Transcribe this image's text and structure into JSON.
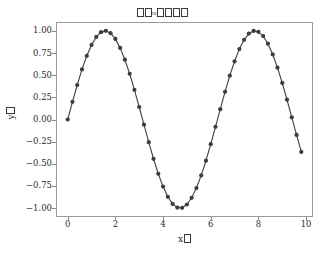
{
  "figure": {
    "width": 325,
    "height": 260,
    "background": "#ffffff"
  },
  "title": {
    "text": "□□nc□□□□",
    "note": "CJK glyphs rendered as missing-glyph boxes",
    "box_count_left": 2,
    "inner_text": "nc",
    "box_count_right": 4
  },
  "axis_labels": {
    "x": {
      "prefix": "x",
      "box_count": 1
    },
    "y": {
      "prefix": "y",
      "box_count": 1
    }
  },
  "style": {
    "line_color": "#404040",
    "marker_color": "#3d3d3d",
    "frame_color": "#9a9a9a",
    "text_color": "#2b2b2b",
    "tick_color": "#8a8a8a"
  },
  "chart_data": {
    "type": "line",
    "xlabel": "x□",
    "ylabel": "y□",
    "xlim": [
      -0.49,
      10.29
    ],
    "ylim": [
      -1.1,
      1.1
    ],
    "xticks": [
      0,
      2,
      4,
      6,
      8,
      10
    ],
    "xtick_labels": [
      "0",
      "2",
      "4",
      "6",
      "8",
      "10"
    ],
    "yticks": [
      1.0,
      0.75,
      0.5,
      0.25,
      0.0,
      -0.25,
      -0.5,
      -0.75,
      -1.0
    ],
    "ytick_labels": [
      "1.00",
      "0.75",
      "0.50",
      "0.25",
      "0.00",
      "−0.25",
      "−0.50",
      "−0.75",
      "−1.00"
    ],
    "grid": false,
    "legend": null,
    "marker": "o",
    "marker_size": 4,
    "series": [
      {
        "name": "sin(x)",
        "x": [
          0.0,
          0.2,
          0.4,
          0.6,
          0.8,
          1.0,
          1.2,
          1.4,
          1.6,
          1.8,
          2.0,
          2.2,
          2.4,
          2.6,
          2.8,
          3.0,
          3.2,
          3.4,
          3.6,
          3.8,
          4.0,
          4.2,
          4.4,
          4.6,
          4.8,
          5.0,
          5.2,
          5.4,
          5.6,
          5.8,
          6.0,
          6.2,
          6.4,
          6.6,
          6.8,
          7.0,
          7.2,
          7.4,
          7.6,
          7.8,
          8.0,
          8.2,
          8.4,
          8.6,
          8.8,
          9.0,
          9.2,
          9.4,
          9.6,
          9.8
        ],
        "y": [
          0.0,
          0.199,
          0.389,
          0.565,
          0.717,
          0.841,
          0.932,
          0.985,
          1.0,
          0.974,
          0.909,
          0.808,
          0.675,
          0.516,
          0.335,
          0.141,
          -0.058,
          -0.256,
          -0.443,
          -0.612,
          -0.757,
          -0.872,
          -0.952,
          -0.994,
          -0.996,
          -0.959,
          -0.883,
          -0.773,
          -0.631,
          -0.465,
          -0.279,
          -0.083,
          0.116,
          0.312,
          0.495,
          0.657,
          0.794,
          0.899,
          0.969,
          0.999,
          0.989,
          0.941,
          0.855,
          0.734,
          0.585,
          0.412,
          0.223,
          0.024,
          -0.174,
          -0.366
        ]
      }
    ]
  }
}
